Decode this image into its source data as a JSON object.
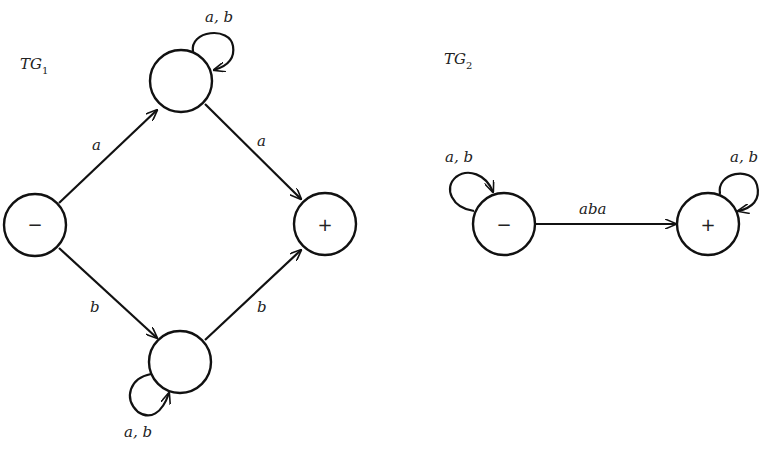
{
  "graphs": [
    {
      "title": "TG",
      "subscript": "1",
      "states": [
        {
          "id": "start",
          "label": "−",
          "type": "start"
        },
        {
          "id": "top",
          "label": "",
          "type": "intermediate"
        },
        {
          "id": "bottom",
          "label": "",
          "type": "intermediate"
        },
        {
          "id": "final",
          "label": "+",
          "type": "final"
        }
      ],
      "edges": [
        {
          "from": "start",
          "to": "top",
          "label": "a"
        },
        {
          "from": "top",
          "to": "final",
          "label": "a"
        },
        {
          "from": "start",
          "to": "bottom",
          "label": "b"
        },
        {
          "from": "bottom",
          "to": "final",
          "label": "b"
        },
        {
          "from": "top",
          "to": "top",
          "label": "a, b"
        },
        {
          "from": "bottom",
          "to": "bottom",
          "label": "a, b"
        }
      ]
    },
    {
      "title": "TG",
      "subscript": "2",
      "states": [
        {
          "id": "start",
          "label": "−",
          "type": "start"
        },
        {
          "id": "final",
          "label": "+",
          "type": "final"
        }
      ],
      "edges": [
        {
          "from": "start",
          "to": "start",
          "label": "a, b"
        },
        {
          "from": "start",
          "to": "final",
          "label": "aba"
        },
        {
          "from": "final",
          "to": "final",
          "label": "a, b"
        }
      ]
    }
  ]
}
